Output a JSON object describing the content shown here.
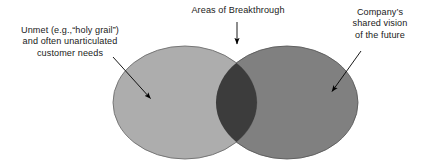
{
  "diagram": {
    "type": "venn-two-circle",
    "background_color": "#ffffff",
    "left_set": {
      "label_lines": [
        "Unmet (e.g.,“holy grail”)",
        "and often unarticulated",
        "customer needs"
      ],
      "fill_color": "#adadad",
      "stroke_color": "#6e6e6e"
    },
    "right_set": {
      "label_lines": [
        "Company’s",
        "shared vision",
        "of the future"
      ],
      "fill_color": "#808080",
      "stroke_color": "#5a5a5a"
    },
    "intersection": {
      "label_lines": [
        "Areas of Breakthrough"
      ],
      "fill_color": "#3c3c3c"
    },
    "arrow_color": "#000000"
  }
}
